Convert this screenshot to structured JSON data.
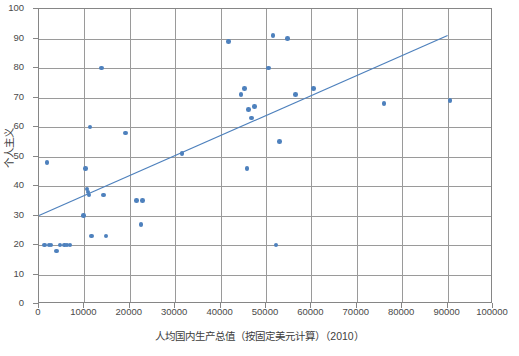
{
  "chart_data": {
    "type": "scatter",
    "title": "",
    "xlabel": "人均国内生产总值（按固定美元计算）（2010）",
    "ylabel": "个人主义",
    "xlim": [
      0,
      100000
    ],
    "ylim": [
      0,
      100
    ],
    "xticks": [
      "0",
      "10000",
      "20000",
      "30000",
      "40000",
      "50000",
      "60000",
      "70000",
      "80000",
      "90000",
      "100000"
    ],
    "yticks": [
      "0",
      "10",
      "20",
      "30",
      "40",
      "50",
      "60",
      "70",
      "80",
      "90",
      "100"
    ],
    "grid": true,
    "legend": false,
    "marker_color": "#4e81bd",
    "trendline_color": "#4e81bd",
    "gridline_color": "#9a9a9a",
    "axis_color": "#868686",
    "trendline": {
      "x": [
        0,
        90000
      ],
      "y": [
        30,
        91
      ]
    },
    "points": [
      {
        "x": 1200,
        "y": 20
      },
      {
        "x": 1800,
        "y": 48
      },
      {
        "x": 2200,
        "y": 20
      },
      {
        "x": 2600,
        "y": 20
      },
      {
        "x": 3800,
        "y": 18
      },
      {
        "x": 4600,
        "y": 20
      },
      {
        "x": 5600,
        "y": 20
      },
      {
        "x": 6200,
        "y": 20
      },
      {
        "x": 6800,
        "y": 20
      },
      {
        "x": 9800,
        "y": 30
      },
      {
        "x": 10200,
        "y": 46
      },
      {
        "x": 10600,
        "y": 39
      },
      {
        "x": 10800,
        "y": 38
      },
      {
        "x": 11000,
        "y": 37
      },
      {
        "x": 11200,
        "y": 60
      },
      {
        "x": 11600,
        "y": 23
      },
      {
        "x": 13800,
        "y": 80
      },
      {
        "x": 14200,
        "y": 37
      },
      {
        "x": 14800,
        "y": 23
      },
      {
        "x": 19000,
        "y": 58
      },
      {
        "x": 21500,
        "y": 35
      },
      {
        "x": 22500,
        "y": 27
      },
      {
        "x": 22800,
        "y": 35
      },
      {
        "x": 31500,
        "y": 51
      },
      {
        "x": 41800,
        "y": 89
      },
      {
        "x": 44500,
        "y": 71
      },
      {
        "x": 45200,
        "y": 73
      },
      {
        "x": 45800,
        "y": 46
      },
      {
        "x": 46200,
        "y": 66
      },
      {
        "x": 46800,
        "y": 63
      },
      {
        "x": 47500,
        "y": 67
      },
      {
        "x": 50500,
        "y": 80
      },
      {
        "x": 51500,
        "y": 91
      },
      {
        "x": 52200,
        "y": 20
      },
      {
        "x": 53000,
        "y": 55
      },
      {
        "x": 54800,
        "y": 90
      },
      {
        "x": 56500,
        "y": 71
      },
      {
        "x": 60500,
        "y": 73
      },
      {
        "x": 76000,
        "y": 68
      },
      {
        "x": 90500,
        "y": 69
      }
    ]
  }
}
